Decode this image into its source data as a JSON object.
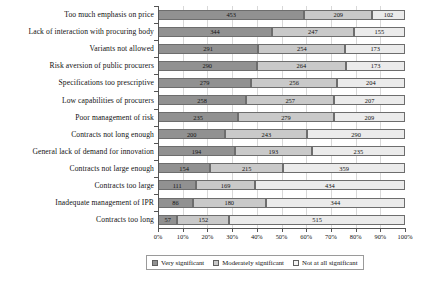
{
  "chart_data": {
    "type": "bar",
    "orientation": "horizontal",
    "stacked": true,
    "normalized": true,
    "title": "",
    "xlabel": "",
    "ylabel": "",
    "xlim": [
      0,
      100
    ],
    "grid": true,
    "legend_position": "bottom",
    "xticks": [
      "0%",
      "10%",
      "20%",
      "30%",
      "40%",
      "50%",
      "60%",
      "70%",
      "80%",
      "90%",
      "100%"
    ],
    "categories": [
      "Too much emphasis on price",
      "Lack of interaction with procuring body",
      "Variants not allowed",
      "Risk aversion of public procurers",
      "Specifications too prescriptive",
      "Low capabilities of procurers",
      "Poor management of risk",
      "Contracts not long enough",
      "General lack of demand for innovation",
      "Contracts not large enough",
      "Contracts too large",
      "Inadequate management of IPR",
      "Contracts too long"
    ],
    "series": [
      {
        "name": "Very significant",
        "color": "#919191",
        "values": [
          453,
          344,
          291,
          290,
          279,
          258,
          235,
          200,
          194,
          154,
          111,
          86,
          57
        ]
      },
      {
        "name": "Moderately significant",
        "color": "#c9c9c9",
        "values": [
          209,
          247,
          254,
          264,
          256,
          257,
          279,
          243,
          193,
          215,
          169,
          180,
          152
        ]
      },
      {
        "name": "Not at all significant",
        "color": "#ebebeb",
        "values": [
          102,
          155,
          173,
          173,
          204,
          207,
          209,
          290,
          235,
          359,
          434,
          344,
          515
        ]
      }
    ],
    "legend": [
      {
        "label": "Very significant",
        "swatch": "s0"
      },
      {
        "label": "Moderately significant",
        "swatch": "s1"
      },
      {
        "label": "Not at all significant",
        "swatch": "s2"
      }
    ]
  }
}
